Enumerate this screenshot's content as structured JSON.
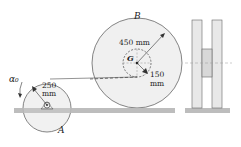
{
  "figure": {
    "wheel_b": {
      "label": "B",
      "outer_radius": "450 mm",
      "hub_radius_value": "150",
      "hub_radius_unit": "mm",
      "center_label": "G"
    },
    "wheel_a": {
      "label": "A",
      "radius_value": "250",
      "radius_unit": "mm",
      "angular_accel_label": "α₀"
    },
    "colors": {
      "ground": "#bdbdbd",
      "wheel_fill": "#f0f0f0",
      "line": "#555555"
    }
  }
}
